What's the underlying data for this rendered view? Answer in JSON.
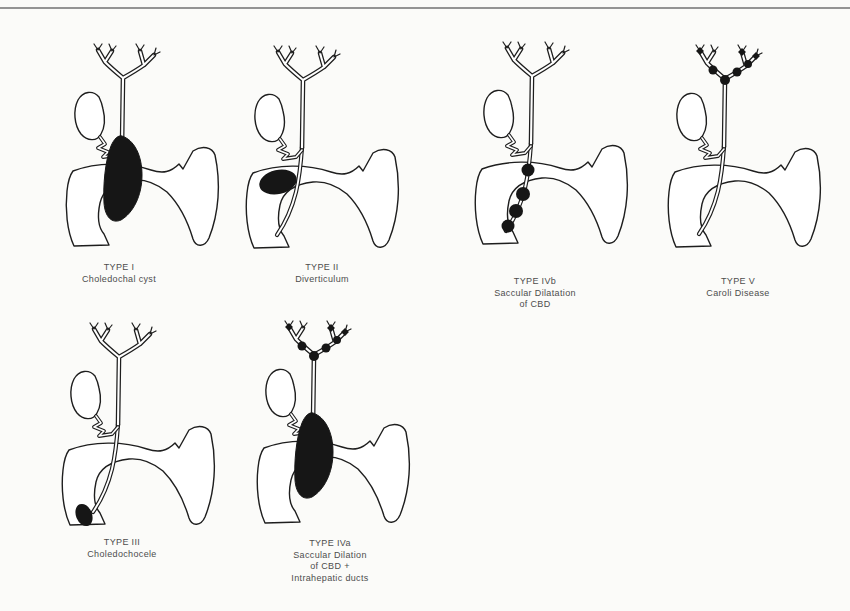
{
  "page": {
    "background_color": "#fbfbf9",
    "top_rule_color": "#949494",
    "ink_color": "#1e1e1e",
    "label_color": "#4d4d4d"
  },
  "panels": [
    {
      "id": "type-i",
      "variant": "fusiform-cyst-of-cbd",
      "label_lines": [
        "TYPE I",
        "Choledochal cyst"
      ]
    },
    {
      "id": "type-ii",
      "variant": "diverticulum-of-cbd",
      "label_lines": [
        "TYPE II",
        "Diverticulum"
      ]
    },
    {
      "id": "type-ivb",
      "variant": "saccular-bead-chain-of-cbd",
      "label_lines": [
        "TYPE IVb",
        "Saccular Dilatation",
        "of CBD"
      ]
    },
    {
      "id": "type-v",
      "variant": "intrahepatic-duct-beads",
      "label_lines": [
        "TYPE V",
        "Caroli Disease"
      ]
    },
    {
      "id": "type-iii",
      "variant": "choledochocele-at-papilla",
      "label_lines": [
        "TYPE III",
        "Choledochocele"
      ]
    },
    {
      "id": "type-iva",
      "variant": "fusiform-cyst-plus-intrahepatic-beads",
      "label_lines": [
        "TYPE IVa",
        "Saccular Dilation",
        "of CBD +",
        "Intrahepatic ducts"
      ]
    }
  ]
}
